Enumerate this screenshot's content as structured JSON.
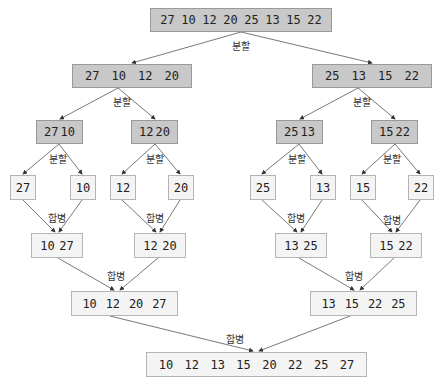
{
  "labels": {
    "split": "분할",
    "merge": "합병"
  },
  "colors": {
    "split_box": "#c8c8c8",
    "merge_box": "#f4f4f4",
    "line": "#555555"
  },
  "split": {
    "root": [
      "27",
      "10",
      "12",
      "20",
      "25",
      "13",
      "15",
      "22"
    ],
    "level1": [
      [
        "27",
        "10",
        "12",
        "20"
      ],
      [
        "25",
        "13",
        "15",
        "22"
      ]
    ],
    "level2": [
      [
        "27",
        "10"
      ],
      [
        "12",
        "20"
      ],
      [
        "25",
        "13"
      ],
      [
        "15",
        "22"
      ]
    ],
    "leaves": [
      [
        "27"
      ],
      [
        "10"
      ],
      [
        "12"
      ],
      [
        "20"
      ],
      [
        "25"
      ],
      [
        "13"
      ],
      [
        "15"
      ],
      [
        "22"
      ]
    ]
  },
  "merge": {
    "level1": [
      [
        "10",
        "27"
      ],
      [
        "12",
        "20"
      ],
      [
        "13",
        "25"
      ],
      [
        "15",
        "22"
      ]
    ],
    "level2": [
      [
        "10",
        "12",
        "20",
        "27"
      ],
      [
        "13",
        "15",
        "22",
        "25"
      ]
    ],
    "final": [
      "10",
      "12",
      "13",
      "15",
      "20",
      "22",
      "25",
      "27"
    ]
  }
}
